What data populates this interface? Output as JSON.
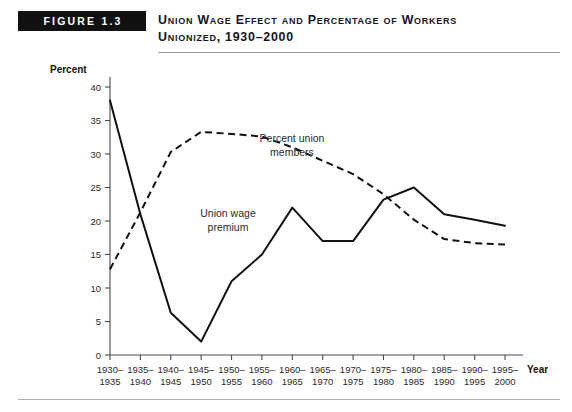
{
  "figure": {
    "badge": "FIGURE 1.3",
    "title_line1": "Union Wage Effect and Percentage of Workers",
    "title_line2": "Unionized, 1930–2000"
  },
  "chart_data": {
    "type": "line",
    "title": "Union Wage Effect and Percentage of Workers Unionized, 1930–2000",
    "xlabel": "Year",
    "ylabel": "Percent",
    "ylim": [
      0,
      40
    ],
    "ytick_step": 5,
    "yticks": [
      0,
      5,
      10,
      15,
      20,
      25,
      30,
      35,
      40
    ],
    "grid": false,
    "legend": "inline-annotations",
    "categories": [
      "1930–\n1935",
      "1935–\n1940",
      "1940–\n1945",
      "1945–\n1950",
      "1950–\n1955",
      "1955–\n1960",
      "1960–\n1965",
      "1965–\n1970",
      "1970–\n1975",
      "1975–\n1980",
      "1980–\n1985",
      "1985–\n1990",
      "1990–\n1995",
      "1995–\n2000"
    ],
    "categories_top": [
      "1930–",
      "1935–",
      "1940–",
      "1945–",
      "1950–",
      "1955–",
      "1960–",
      "1965–",
      "1970–",
      "1975–",
      "1980–",
      "1985–",
      "1990–",
      "1995–"
    ],
    "categories_bottom": [
      "1935",
      "1940",
      "1945",
      "1950",
      "1955",
      "1960",
      "1965",
      "1970",
      "1975",
      "1980",
      "1985",
      "1990",
      "1995",
      "2000"
    ],
    "series": [
      {
        "name": "Union wage premium",
        "style": "solid",
        "color": "#111111",
        "values": [
          38.0,
          21.0,
          6.3,
          2.0,
          11.0,
          15.0,
          22.0,
          17.0,
          17.0,
          23.2,
          25.0,
          21.0,
          20.2,
          19.3
        ]
      },
      {
        "name": "Percent union members",
        "style": "dashed",
        "color": "#111111",
        "values": [
          12.8,
          21.3,
          30.3,
          33.3,
          33.0,
          32.6,
          31.0,
          29.0,
          27.0,
          24.0,
          20.2,
          17.3,
          16.7,
          16.5
        ]
      }
    ],
    "annotations": [
      {
        "text_line1": "Percent union",
        "text_line2": "members",
        "series": "Percent union members"
      },
      {
        "text_line1": "Union wage",
        "text_line2": "premium",
        "series": "Union wage premium"
      }
    ]
  }
}
